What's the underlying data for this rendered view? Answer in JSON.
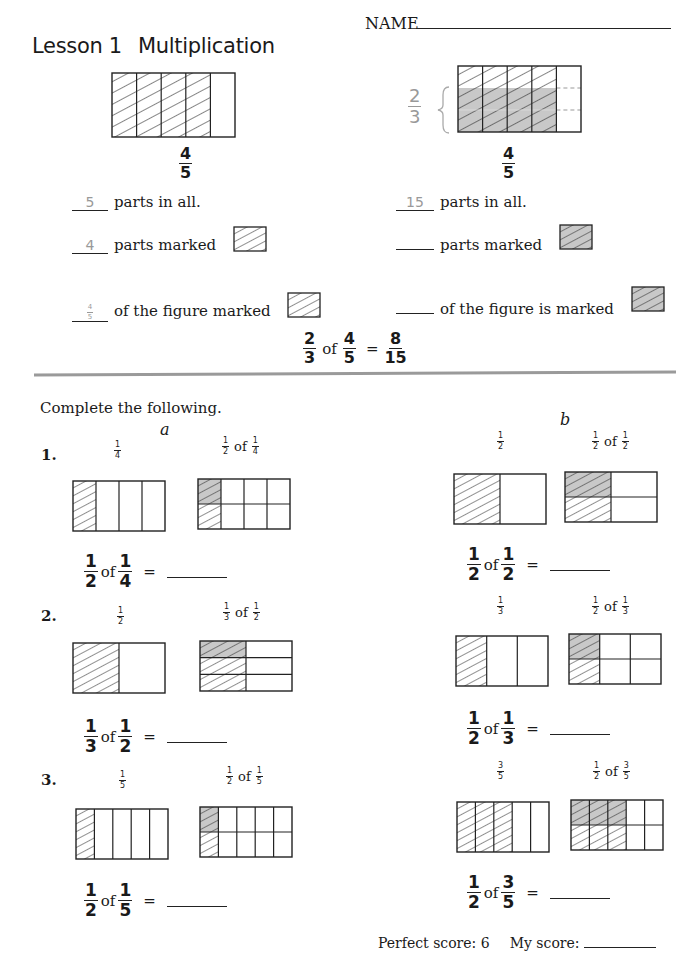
{
  "header": {
    "lesson_label": "Lesson 1",
    "lesson_title": "Multiplication",
    "name_label": "NAME"
  },
  "example": {
    "left": {
      "figure_fraction": {
        "num": "4",
        "den": "5"
      },
      "parts_in_all_answer": "5",
      "parts_in_all_label": "parts in all.",
      "parts_marked_answer": "4",
      "parts_marked_label": "parts marked",
      "figure_marked_answer": {
        "num": "4",
        "den": "5"
      },
      "figure_marked_label": "of the figure marked"
    },
    "right": {
      "side_fraction": {
        "num": "2",
        "den": "3"
      },
      "figure_fraction": {
        "num": "4",
        "den": "5"
      },
      "parts_in_all_answer": "15",
      "parts_in_all_label": "parts in all.",
      "parts_marked_answer": "",
      "parts_marked_label": "parts marked",
      "figure_marked_answer": "",
      "figure_marked_label": "of the figure is marked"
    },
    "equation": {
      "a": {
        "num": "2",
        "den": "3"
      },
      "of": "of",
      "b": {
        "num": "4",
        "den": "5"
      },
      "equals": "=",
      "result": {
        "num": "8",
        "den": "15"
      }
    }
  },
  "exercises": {
    "instructions": "Complete the following.",
    "column_a_label": "a",
    "column_b_label": "b",
    "of": "of",
    "equals": "=",
    "items": [
      {
        "number": "1.",
        "a": {
          "first": {
            "num": "1",
            "den": "4"
          },
          "second_a": {
            "num": "1",
            "den": "2"
          },
          "second_b": {
            "num": "1",
            "den": "4"
          },
          "answer": ""
        },
        "b": {
          "first": {
            "num": "1",
            "den": "2"
          },
          "second_a": {
            "num": "1",
            "den": "2"
          },
          "second_b": {
            "num": "1",
            "den": "2"
          },
          "answer": ""
        }
      },
      {
        "number": "2.",
        "a": {
          "first": {
            "num": "1",
            "den": "2"
          },
          "second_a": {
            "num": "1",
            "den": "3"
          },
          "second_b": {
            "num": "1",
            "den": "2"
          },
          "answer": ""
        },
        "b": {
          "first": {
            "num": "1",
            "den": "3"
          },
          "second_a": {
            "num": "1",
            "den": "2"
          },
          "second_b": {
            "num": "1",
            "den": "3"
          },
          "answer": ""
        }
      },
      {
        "number": "3.",
        "a": {
          "first": {
            "num": "1",
            "den": "5"
          },
          "second_a": {
            "num": "1",
            "den": "2"
          },
          "second_b": {
            "num": "1",
            "den": "5"
          },
          "answer": ""
        },
        "b": {
          "first": {
            "num": "3",
            "den": "5"
          },
          "second_a": {
            "num": "1",
            "den": "2"
          },
          "second_b": {
            "num": "3",
            "den": "5"
          },
          "answer": ""
        }
      }
    ]
  },
  "footer": {
    "perfect_score_label": "Perfect score: 6",
    "my_score_label": "My score:",
    "my_score_value": ""
  },
  "colors": {
    "ink": "#1a1a1a",
    "answer_gray": "#999999",
    "shade_gray": "#c8c8c8",
    "divider": "#9a9a9a"
  }
}
